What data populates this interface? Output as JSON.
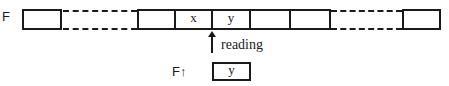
{
  "file": {
    "label": "F",
    "cells": [
      "",
      "",
      "x",
      "y",
      "",
      "",
      ""
    ]
  },
  "pointer": {
    "label": "reading"
  },
  "buffer": {
    "label": "F↑",
    "value": "y"
  }
}
